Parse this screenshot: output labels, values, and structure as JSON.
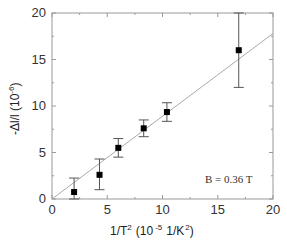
{
  "chart_data": {
    "type": "scatter",
    "title": "",
    "xlabel": "1/T² (10⁻⁵ 1/K²)",
    "ylabel": "-Δl/l (10⁻⁶)",
    "xlim": [
      0,
      20
    ],
    "ylim": [
      0,
      20
    ],
    "x_ticks": [
      0,
      5,
      10,
      15,
      20
    ],
    "y_ticks": [
      0,
      5,
      10,
      15,
      20
    ],
    "grid": false,
    "legend": null,
    "annotations": [
      "B = 0.36 T"
    ],
    "series": [
      {
        "name": "data",
        "marker": "square",
        "x": [
          2.0,
          4.3,
          6.0,
          8.3,
          10.4,
          16.9
        ],
        "y": [
          0.75,
          2.6,
          5.5,
          7.6,
          9.35,
          16.0
        ],
        "y_err_low": [
          0.75,
          1.6,
          1.0,
          0.9,
          1.0,
          4.0
        ],
        "y_err_high": [
          1.5,
          1.7,
          1.0,
          0.9,
          1.0,
          4.0
        ]
      },
      {
        "name": "linear fit",
        "type": "line",
        "x": [
          0,
          20
        ],
        "y": [
          0,
          17.8
        ]
      }
    ]
  },
  "labels": {
    "x_axis": "1/T",
    "x_axis_sup1": "2",
    "x_axis_mid": "(10",
    "x_axis_sup2": "-5",
    "x_axis_unit": "1/K",
    "x_axis_sup3": "2",
    "x_axis_end": ")",
    "y_axis": "-Δl/l (10",
    "y_axis_sup": "-6",
    "y_axis_end": ")",
    "annotation": "B = 0.36 T"
  }
}
